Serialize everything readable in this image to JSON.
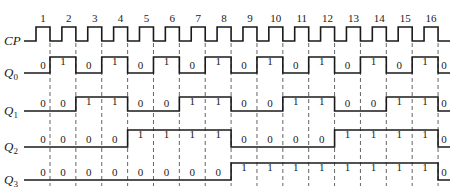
{
  "diagram": {
    "clock": {
      "label": "CP",
      "pulse_numbers": [
        "1",
        "2",
        "3",
        "4",
        "5",
        "6",
        "7",
        "8",
        "9",
        "10",
        "11",
        "12",
        "13",
        "14",
        "15",
        "16"
      ]
    },
    "signals": [
      {
        "label": "Q",
        "subscript": "0",
        "values": [
          0,
          1,
          0,
          1,
          0,
          1,
          0,
          1,
          0,
          1,
          0,
          1,
          0,
          1,
          0,
          1,
          0
        ]
      },
      {
        "label": "Q",
        "subscript": "1",
        "values": [
          0,
          0,
          1,
          1,
          0,
          0,
          1,
          1,
          0,
          0,
          1,
          1,
          0,
          0,
          1,
          1,
          0
        ]
      },
      {
        "label": "Q",
        "subscript": "2",
        "values": [
          0,
          0,
          0,
          0,
          1,
          1,
          1,
          1,
          0,
          0,
          0,
          0,
          1,
          1,
          1,
          1,
          0
        ]
      },
      {
        "label": "Q",
        "subscript": "3",
        "values": [
          0,
          0,
          0,
          0,
          0,
          0,
          0,
          0,
          1,
          1,
          1,
          1,
          1,
          1,
          1,
          1,
          0
        ]
      }
    ],
    "colors": {
      "line": "#1a1a1a",
      "dash": "#555555",
      "background": "#ffffff"
    }
  }
}
